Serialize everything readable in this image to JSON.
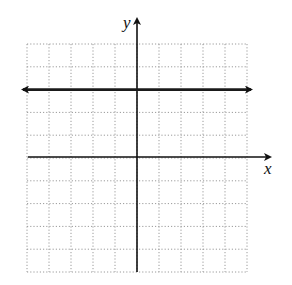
{
  "graph": {
    "x_label": "x",
    "y_label": "y",
    "x_range": [
      -5,
      5
    ],
    "y_range": [
      -5,
      5
    ],
    "grid_step": 1,
    "grid_style": "dotted",
    "colors": {
      "axes": "#111111",
      "grid": "#9a9a9a",
      "line": "#1a1a1a",
      "background": "#ffffff"
    }
  },
  "chart_data": {
    "type": "line",
    "title": "",
    "xlabel": "x",
    "ylabel": "y",
    "xlim": [
      -5,
      5
    ],
    "ylim": [
      -5,
      5
    ],
    "grid": true,
    "series": [
      {
        "name": "y = 3",
        "x": [
          -5,
          5
        ],
        "values": [
          3,
          3
        ],
        "arrows": "both"
      }
    ]
  }
}
